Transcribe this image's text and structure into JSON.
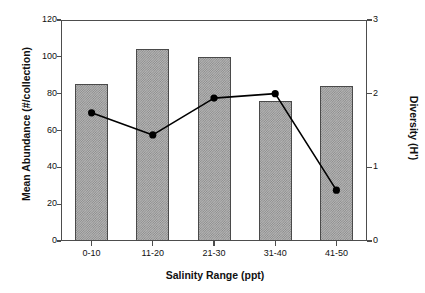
{
  "chart_data": {
    "type": "bar",
    "title": "",
    "subtitle": "",
    "xlabel": "Salinity Range (ppt)",
    "ylabel": "Mean Abundance (#/collection)",
    "y2label": "Diversity (H')",
    "categories": [
      "0-10",
      "11-20",
      "21-30",
      "31-40",
      "41-50"
    ],
    "ylim": [
      0,
      120
    ],
    "yticks": [
      0,
      20,
      40,
      60,
      80,
      100,
      120
    ],
    "ytick_labels": [
      "0",
      "20",
      "40",
      "60",
      "80",
      "100",
      "120"
    ],
    "y2lim": [
      0,
      3
    ],
    "y2ticks": [
      0,
      1,
      2,
      3
    ],
    "y2tick_labels": [
      "0",
      "1",
      "2",
      "3"
    ],
    "grid": false,
    "legend": "none",
    "series": [
      {
        "name": "Mean Abundance (#/collection)",
        "type": "bar",
        "axis": "left",
        "fill": "hatched-gray",
        "edge_color": "#4a4a4a",
        "values": [
          85,
          104,
          100,
          76,
          84
        ]
      },
      {
        "name": "Diversity (H')",
        "type": "line",
        "axis": "right",
        "marker": "filled-circle",
        "color": "#000000",
        "values": [
          1.74,
          1.44,
          1.94,
          2.0,
          0.69
        ]
      }
    ]
  },
  "colors": {
    "background": "#ffffff",
    "axis": "#4d4d4d",
    "text": "#111111",
    "bar_fill": "#b4b4b4",
    "bar_hatch": "#8a8a8a",
    "bar_edge": "#4a4a4a",
    "line": "#000000"
  }
}
